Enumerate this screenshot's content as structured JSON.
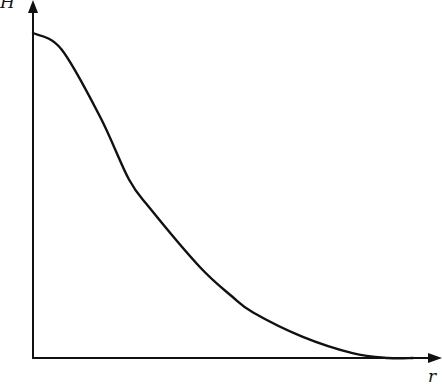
{
  "chart_data": {
    "type": "line",
    "title": "",
    "xlabel": "r",
    "ylabel": "H",
    "grid": false,
    "legend": null,
    "xlim": [
      0,
      1.15
    ],
    "ylim": [
      0,
      1.08
    ],
    "ticks": {
      "x": [],
      "y": []
    },
    "series": [
      {
        "name": "H(r)",
        "x": [
          0.0,
          0.08,
          0.19,
          0.27,
          0.33,
          0.47,
          0.56,
          0.62,
          0.76,
          0.9,
          1.0,
          1.07
        ],
        "y": [
          1.0,
          0.95,
          0.74,
          0.55,
          0.46,
          0.28,
          0.19,
          0.14,
          0.065,
          0.015,
          0.0,
          0.0
        ]
      }
    ],
    "colors": {
      "line": "#111111",
      "axes": "#111111",
      "background": "#ffffff"
    }
  },
  "labels": {
    "x_axis": "r",
    "y_axis": "H"
  }
}
